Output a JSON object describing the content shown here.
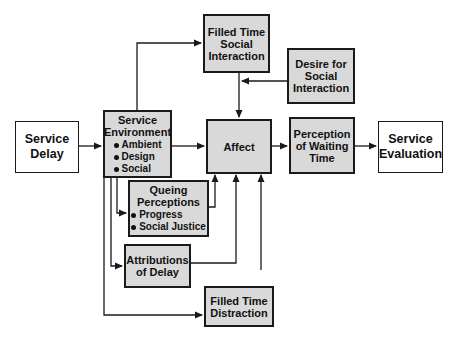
{
  "diagram": {
    "type": "flowchart",
    "nodes": {
      "service_delay": {
        "label": "Service Delay",
        "lines": [
          "Service",
          "Delay"
        ],
        "style": "plain"
      },
      "service_environment": {
        "label": "Service Environment",
        "lines": [
          "Service",
          "Environment"
        ],
        "bullets": [
          "Ambient",
          "Design",
          "Social"
        ],
        "style": "shaded"
      },
      "filled_time_social": {
        "label": "Filled Time Social Interaction",
        "lines": [
          "Filled Time",
          "Social",
          "Interaction"
        ],
        "style": "shaded"
      },
      "desire_social": {
        "label": "Desire for Social Interaction",
        "lines": [
          "Desire for",
          "Social",
          "Interaction"
        ],
        "style": "shaded"
      },
      "affect": {
        "label": "Affect",
        "lines": [
          "Affect"
        ],
        "style": "shaded"
      },
      "perception_waiting": {
        "label": "Perception of Waiting Time",
        "lines": [
          "Perception",
          "of Waiting",
          "Time"
        ],
        "style": "shaded"
      },
      "service_evaluation": {
        "label": "Service Evaluation",
        "lines": [
          "Service",
          "Evaluation"
        ],
        "style": "plain"
      },
      "queing_perceptions": {
        "label": "Queing Perceptions",
        "lines": [
          "Queing",
          "Perceptions"
        ],
        "bullets": [
          "Progress",
          "Social Justice"
        ],
        "style": "shaded"
      },
      "attributions_delay": {
        "label": "Attributions of Delay",
        "lines": [
          "Attributions",
          "of Delay"
        ],
        "style": "shaded"
      },
      "filled_time_distraction": {
        "label": "Filled Time Distraction",
        "lines": [
          "Filled Time",
          "Distraction"
        ],
        "style": "shaded"
      }
    },
    "edges": [
      {
        "from": "service_delay",
        "to": "service_environment"
      },
      {
        "from": "service_environment",
        "to": "affect"
      },
      {
        "from": "service_environment",
        "to": "filled_time_social"
      },
      {
        "from": "service_environment",
        "to": "queing_perceptions"
      },
      {
        "from": "service_environment",
        "to": "attributions_delay"
      },
      {
        "from": "service_environment",
        "to": "filled_time_distraction"
      },
      {
        "from": "filled_time_social",
        "to": "affect"
      },
      {
        "from": "desire_social",
        "to": "filled_time_social_affect_link"
      },
      {
        "from": "queing_perceptions",
        "to": "affect"
      },
      {
        "from": "attributions_delay",
        "to": "affect"
      },
      {
        "from": "filled_time_distraction",
        "to": "affect"
      },
      {
        "from": "affect",
        "to": "perception_waiting"
      },
      {
        "from": "perception_waiting",
        "to": "service_evaluation"
      }
    ],
    "colors": {
      "shaded_fill": "#d9d9d9",
      "plain_fill": "#ffffff",
      "stroke": "#1a1a1a"
    }
  }
}
